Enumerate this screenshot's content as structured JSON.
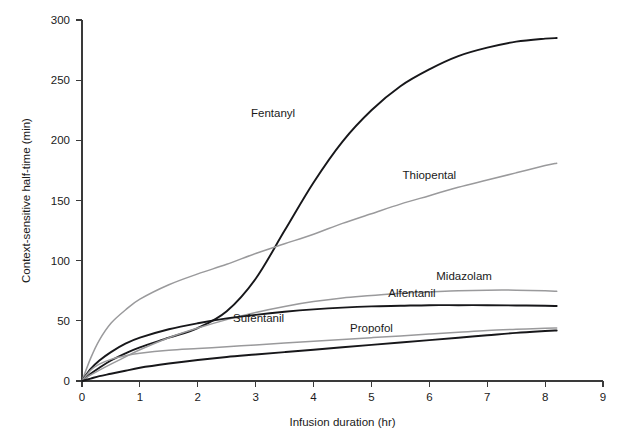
{
  "chart_data": {
    "type": "line",
    "title": "",
    "xlabel": "Infusion duration (hr)",
    "ylabel": "Context-sensitive half-time (min)",
    "xlim": [
      0,
      9
    ],
    "ylim": [
      0,
      300
    ],
    "xticks": [
      0,
      1,
      2,
      3,
      4,
      5,
      6,
      7,
      8,
      9
    ],
    "xtick_labels": [
      "0",
      "1",
      "2",
      "3",
      "4",
      "5",
      "6",
      "7",
      "8",
      "9"
    ],
    "yticks": [
      0,
      50,
      100,
      150,
      200,
      250,
      300
    ],
    "ytick_labels": [
      "0",
      "50",
      "100",
      "150",
      "200",
      "250",
      "300"
    ],
    "grid": false,
    "legend": "inline-annotations",
    "x": [
      0,
      0.15,
      0.3,
      0.5,
      0.75,
      1,
      1.5,
      2,
      2.5,
      3,
      3.5,
      4,
      4.5,
      5,
      5.5,
      6,
      6.5,
      7,
      7.5,
      8,
      8.2
    ],
    "series": [
      {
        "name": "Fentanyl",
        "color": "#17171a",
        "width": 1.9,
        "label_x": 3.3,
        "label_y": 219,
        "values": [
          0,
          6,
          11,
          17,
          23,
          28,
          36,
          44,
          58,
          85,
          125,
          165,
          199,
          225,
          245,
          259,
          270,
          277,
          282,
          284.5,
          285
        ]
      },
      {
        "name": "Thiopental",
        "color": "#9a9a9c",
        "width": 1.5,
        "label_x": 6.0,
        "label_y": 168,
        "values": [
          0,
          19,
          34,
          48,
          59,
          68,
          80,
          89,
          97,
          106,
          114,
          122,
          131,
          139,
          147,
          154,
          161,
          167,
          173,
          179,
          181
        ]
      },
      {
        "name": "Midazolam",
        "color": "#9a9a9c",
        "width": 1.5,
        "label_x": 6.6,
        "label_y": 84,
        "values": [
          0,
          5,
          9,
          14,
          20,
          26,
          36,
          44,
          51,
          57,
          62,
          66,
          69,
          71,
          73,
          74,
          75,
          75.5,
          75.5,
          75,
          74.5
        ]
      },
      {
        "name": "Alfentanil",
        "color": "#17171a",
        "width": 1.9,
        "label_x": 5.7,
        "label_y": 70,
        "values": [
          0,
          10,
          17,
          24,
          31,
          36,
          43,
          48,
          52,
          55,
          57.5,
          59.5,
          61,
          62,
          62.5,
          63,
          63,
          63,
          62.8,
          62.5,
          62.3
        ]
      },
      {
        "name": "Sufentanil",
        "color": "#9a9a9c",
        "width": 1.5,
        "label_x": 3.05,
        "label_y": 49,
        "values": [
          0,
          9,
          14,
          18,
          21,
          23,
          25.5,
          27,
          28.5,
          30,
          31.5,
          33,
          34.5,
          36,
          37.5,
          39,
          40.5,
          42,
          43,
          43.8,
          44
        ]
      },
      {
        "name": "Propofol",
        "color": "#17171a",
        "width": 1.9,
        "label_x": 5.0,
        "label_y": 41,
        "values": [
          0,
          2,
          4,
          6,
          8.5,
          11,
          14.5,
          17.5,
          20,
          22,
          24,
          26,
          28,
          30,
          32,
          34,
          36,
          38,
          40,
          41.5,
          42
        ]
      }
    ]
  },
  "caption": {
    "text": ""
  }
}
